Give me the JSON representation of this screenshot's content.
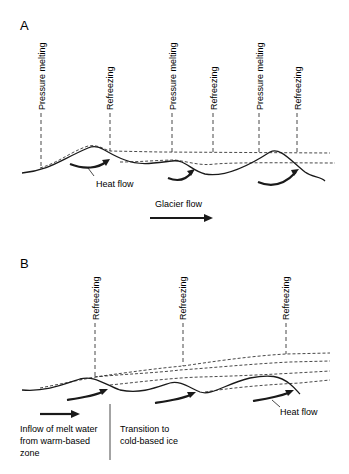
{
  "panel_a": {
    "label": "A",
    "vertical_labels": [
      "Pressure melting",
      "Refreezing",
      "Pressure melting",
      "Refreezing",
      "Pressure melting",
      "Refreezing"
    ],
    "heat_flow_label": "Heat flow",
    "glacier_flow_label": "Glacier flow"
  },
  "panel_b": {
    "label": "B",
    "vertical_labels": [
      "Refreezing",
      "Refreezing",
      "Refreezing"
    ],
    "heat_flow_label": "Heat flow",
    "inflow_label_1": "Inflow of melt water",
    "inflow_label_2": "from warm-based",
    "inflow_label_3": "zone",
    "transition_label_1": "Transition to",
    "transition_label_2": "cold-based ice"
  },
  "colors": {
    "line": "#1a1a1a",
    "background": "#ffffff"
  }
}
